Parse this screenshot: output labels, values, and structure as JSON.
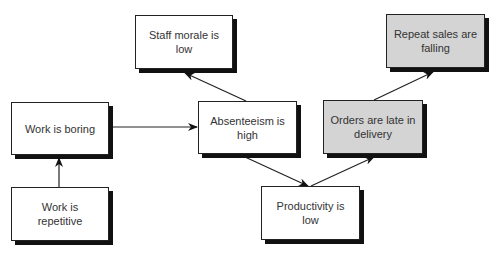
{
  "diagram": {
    "nodes": [
      {
        "id": "staff-morale",
        "label": "Staff morale is low",
        "shaded": false
      },
      {
        "id": "repeat-sales",
        "label": "Repeat sales are falling",
        "shaded": true
      },
      {
        "id": "work-boring",
        "label": "Work is boring",
        "shaded": false
      },
      {
        "id": "absenteeism",
        "label": "Absenteeism is high",
        "shaded": false
      },
      {
        "id": "orders-late",
        "label": "Orders are late in delivery",
        "shaded": true
      },
      {
        "id": "work-repetitive",
        "label": "Work is repetitive",
        "shaded": false
      },
      {
        "id": "productivity",
        "label": "Productivity is low",
        "shaded": false
      }
    ],
    "edges": [
      {
        "from": "work-repetitive",
        "to": "work-boring"
      },
      {
        "from": "work-boring",
        "to": "absenteeism"
      },
      {
        "from": "absenteeism",
        "to": "staff-morale"
      },
      {
        "from": "absenteeism",
        "to": "productivity"
      },
      {
        "from": "productivity",
        "to": "orders-late"
      },
      {
        "from": "orders-late",
        "to": "repeat-sales"
      }
    ],
    "colors": {
      "shaded_fill": "#d4d4d4",
      "plain_fill": "#ffffff",
      "border": "#222222",
      "shadow": "#111111",
      "text": "#333333"
    }
  }
}
